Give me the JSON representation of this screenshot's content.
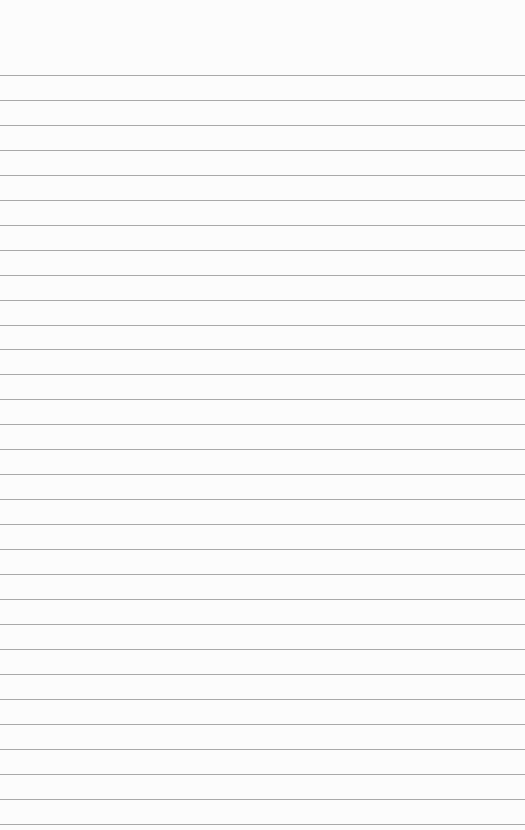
{
  "paper": {
    "type": "lined-paper",
    "background_color": "#fcfcfc",
    "line_color": "#9a9a9a",
    "line_count": 31,
    "first_line_y": 75,
    "line_spacing": 24.95,
    "width": 525,
    "height": 830
  }
}
